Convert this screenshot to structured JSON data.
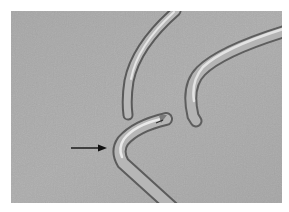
{
  "image": {
    "description": "Grayscale photograph of three bent metal needle tips on a textured surface, with an arrow pointing to the bend of the lower instrument",
    "colors": {
      "background": "#ffffff",
      "surface": "#a9a9a9",
      "metal_light": "#e6e6e6",
      "metal_mid": "#9a9a9a",
      "metal_dark": "#5e5e5e",
      "arrow": "#111111"
    },
    "annotations": [
      {
        "type": "arrow",
        "direction": "right",
        "points_to": "bend of lower instrument"
      }
    ]
  }
}
